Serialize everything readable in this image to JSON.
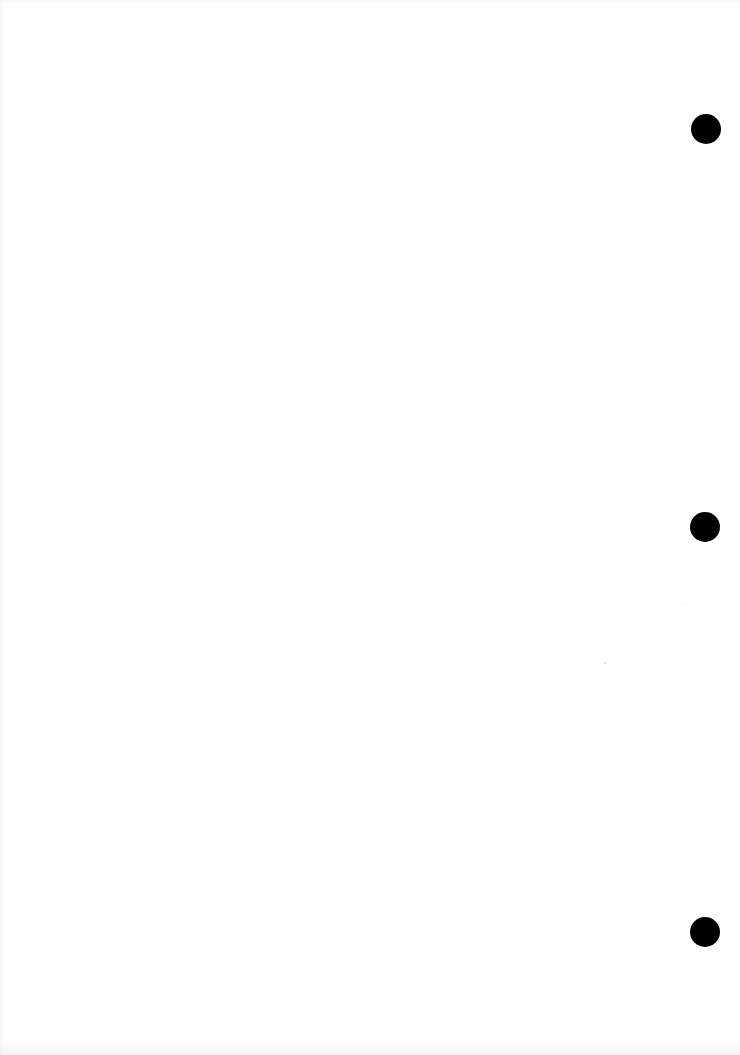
{
  "page": {
    "type": "scanned blank sheet",
    "background_color": "#ffffff",
    "text_content": ""
  },
  "punch_holes": {
    "color": "#000000",
    "diameter": 30,
    "items": [
      {
        "cx": 706,
        "cy": 129
      },
      {
        "cx": 705,
        "cy": 527
      },
      {
        "cx": 705,
        "cy": 932
      }
    ]
  }
}
